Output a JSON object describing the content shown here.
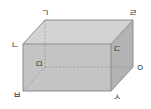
{
  "diagram": {
    "type": "cuboid",
    "colors": {
      "top_face": "#d3d3d3",
      "front_face": "#c4c4c4",
      "side_face": "#b3b3b3",
      "edge": "#8c8c8c",
      "hidden_edge": "#9a9a9a",
      "label": "#333333"
    },
    "vertices": {
      "back_top_left": "ㄱ",
      "front_top_left": "ㄴ",
      "front_top_right": "ㄷ",
      "back_top_right": "ㄹ",
      "back_bottom_left": "ㅁ",
      "front_bottom_left": "ㅂ",
      "front_bottom_right": "ㅅ",
      "back_bottom_right": "ㅇ"
    }
  }
}
